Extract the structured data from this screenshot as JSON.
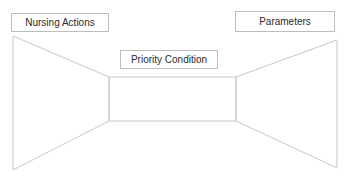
{
  "diagram": {
    "labels": {
      "nursing_actions": "Nursing Actions",
      "parameters": "Parameters",
      "priority_condition": "Priority Condition"
    },
    "stroke_color": "#c8c8c8",
    "box_border_color": "#bdbdbd",
    "shapes": {
      "left_panel": "trapezoid-left",
      "center_panel": "rectangle-center",
      "right_panel": "trapezoid-right"
    }
  }
}
